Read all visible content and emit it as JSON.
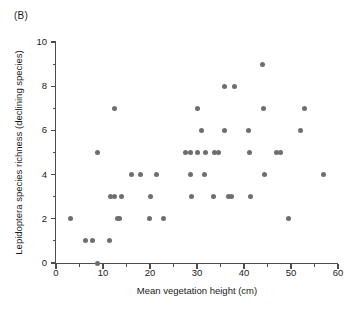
{
  "panel": {
    "label": "(B)"
  },
  "colors": {
    "point": "#6e6e6e",
    "axis": "#4d4d4d",
    "text": "#1a1a1a",
    "background": "#ffffff"
  },
  "chart_data": {
    "type": "scatter",
    "title": "",
    "panel_label": "(B)",
    "xlabel": "Mean vegetation height (cm)",
    "ylabel": "Lepidoptera species richness (declining species)",
    "xlim": [
      0,
      60
    ],
    "ylim": [
      0,
      10
    ],
    "xticks": [
      0,
      10,
      20,
      30,
      40,
      50,
      60
    ],
    "xticklabels": [
      "0",
      "10",
      "20",
      "30",
      "40",
      "50",
      "60"
    ],
    "xminorticks": [
      5,
      15,
      25,
      35,
      45,
      55
    ],
    "yticks": [
      0,
      2,
      4,
      6,
      8,
      10
    ],
    "yticklabels": [
      "0",
      "2",
      "4",
      "6",
      "8",
      "10"
    ],
    "yminorticks": [
      1,
      3,
      5,
      7,
      9
    ],
    "grid": false,
    "legend": null,
    "marker": "filled-circle",
    "marker_color": "#6e6e6e",
    "points": [
      [
        3.1,
        2
      ],
      [
        6.2,
        1
      ],
      [
        7.8,
        1
      ],
      [
        8.8,
        0
      ],
      [
        8.9,
        5
      ],
      [
        11.3,
        1
      ],
      [
        11.5,
        3
      ],
      [
        12.4,
        3
      ],
      [
        12.5,
        7
      ],
      [
        13.1,
        2
      ],
      [
        13.6,
        2
      ],
      [
        14.0,
        3
      ],
      [
        16.1,
        4
      ],
      [
        17.9,
        4
      ],
      [
        19.8,
        2
      ],
      [
        20.1,
        3
      ],
      [
        21.3,
        4
      ],
      [
        22.8,
        2
      ],
      [
        27.5,
        5
      ],
      [
        28.6,
        4
      ],
      [
        28.7,
        5
      ],
      [
        28.9,
        3
      ],
      [
        30.0,
        5
      ],
      [
        30.9,
        6
      ],
      [
        30.2,
        7
      ],
      [
        31.5,
        4
      ],
      [
        31.9,
        5
      ],
      [
        33.6,
        3
      ],
      [
        33.7,
        5
      ],
      [
        34.6,
        5
      ],
      [
        35.9,
        8
      ],
      [
        35.9,
        6
      ],
      [
        36.7,
        3
      ],
      [
        37.4,
        3
      ],
      [
        37.9,
        8
      ],
      [
        41.0,
        6
      ],
      [
        41.2,
        5
      ],
      [
        41.3,
        3
      ],
      [
        44.0,
        9
      ],
      [
        44.1,
        7
      ],
      [
        44.3,
        4
      ],
      [
        46.9,
        5
      ],
      [
        47.8,
        5
      ],
      [
        49.4,
        2
      ],
      [
        52.0,
        6
      ],
      [
        52.9,
        7
      ],
      [
        57.0,
        4
      ]
    ],
    "n_points": 47
  }
}
